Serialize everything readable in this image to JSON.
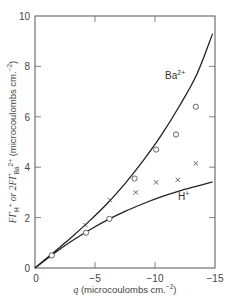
{
  "chart_data": {
    "type": "scatter",
    "title": "",
    "xlabel": "q (microcoulombs cm.^-2)",
    "ylabel": "FΓH+ or 2FΓBa2+ (microcoulombs cm.^-2)",
    "xlim": [
      0,
      -15
    ],
    "ylim": [
      0,
      10
    ],
    "x_ticks": [
      "0",
      "−5",
      "−10",
      "−15"
    ],
    "y_ticks": [
      "0",
      "2",
      "4",
      "6",
      "8",
      "10"
    ],
    "grid": false,
    "series": [
      {
        "name": "Ba2+ (theory curve)",
        "kind": "line",
        "label": "Ba",
        "label_sup": "2+",
        "x": [
          0,
          -1.5,
          -3,
          -4.5,
          -6,
          -7.5,
          -9,
          -10.5,
          -12,
          -13.5,
          -14.8
        ],
        "y": [
          0,
          0.6,
          1.2,
          1.85,
          2.55,
          3.35,
          4.25,
          5.25,
          6.4,
          7.7,
          9.3
        ]
      },
      {
        "name": "H+ (theory curve)",
        "kind": "line",
        "label": "H",
        "label_sup": "+",
        "x": [
          0,
          -1.5,
          -3,
          -4.5,
          -6,
          -7.5,
          -9,
          -10.5,
          -12,
          -13.5,
          -14.8
        ],
        "y": [
          0,
          0.55,
          1.05,
          1.5,
          1.9,
          2.25,
          2.55,
          2.82,
          3.05,
          3.25,
          3.42
        ]
      },
      {
        "name": "Ba2+ (experimental, circles)",
        "kind": "scatter",
        "marker": "circle",
        "x": [
          -1.4,
          -4.25,
          -6.2,
          -8.3,
          -10.1,
          -11.75,
          -13.4
        ],
        "y": [
          0.5,
          1.4,
          1.95,
          3.55,
          4.7,
          5.3,
          6.4
        ]
      },
      {
        "name": "H+ (experimental, crosses)",
        "kind": "scatter",
        "marker": "x",
        "x": [
          -4.2,
          -6.25,
          -8.4,
          -10.1,
          -11.9,
          -13.4
        ],
        "y": [
          1.7,
          2.7,
          3.0,
          3.4,
          3.5,
          4.15
        ]
      }
    ],
    "legend": "inline curve labels (Ba2+ near upper curve, H+ near lower curve)"
  },
  "labels": {
    "x_axis": {
      "q": "q",
      "rest": " (microcoulombs cm.",
      "sup": "−2",
      "close": ")"
    },
    "y_axis": {
      "part1": "FΓ",
      "sub1": "H",
      "sup1": "+",
      "mid": " or 2FΓ",
      "sub2": "Ba",
      "sup2": "2+",
      "rest": " (microcoulombs cm.",
      "sup3": "−2",
      "close": ")"
    },
    "origin_y": "0",
    "ba_label": "Ba",
    "ba_sup": "2+",
    "h_label": "H",
    "h_sup": "+"
  }
}
